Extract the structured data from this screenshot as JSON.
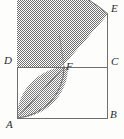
{
  "figure": {
    "kind": "geometry-diagram",
    "background_color": "#fdfdfc",
    "stroke_color": "#6b6b6b",
    "shade_fill_color": "#7a7a7a",
    "shade_pattern": "checkerboard-dither",
    "label_color": "#2b2b2b",
    "labels": [
      {
        "id": "A",
        "text": "A",
        "x": 6,
        "y": 120,
        "anchor": "bottom-left-vertex"
      },
      {
        "id": "B",
        "text": "B",
        "x": 110,
        "y": 110,
        "anchor": "bottom-right-vertex"
      },
      {
        "id": "C",
        "text": "C",
        "x": 111,
        "y": 57,
        "anchor": "top-right-of-rectangle"
      },
      {
        "id": "D",
        "text": "D",
        "x": 5,
        "y": 56,
        "anchor": "top-left-of-rectangle"
      },
      {
        "id": "E",
        "text": "E",
        "x": 111,
        "y": 4,
        "anchor": "arc-endpoint-top"
      },
      {
        "id": "F",
        "text": "F",
        "x": 66,
        "y": 61,
        "anchor": "arc-intersection-on-DC"
      }
    ],
    "points": {
      "A": {
        "x": 17,
        "y": 118
      },
      "B": {
        "x": 108,
        "y": 118
      },
      "C": {
        "x": 108,
        "y": 67
      },
      "D": {
        "x": 17,
        "y": 67
      },
      "E": {
        "x": 108,
        "y": 14
      },
      "F": {
        "x": 64,
        "y": 67
      }
    },
    "segments": [
      {
        "name": "AB",
        "from": "A",
        "to": "B"
      },
      {
        "name": "BE",
        "from": "B",
        "to": "E"
      },
      {
        "name": "DC",
        "from": "D",
        "to": "C"
      },
      {
        "name": "AD",
        "from": "A",
        "to": "D"
      },
      {
        "name": "AF-extended",
        "from": "A",
        "to": "arc"
      }
    ],
    "arcs": [
      {
        "name": "arc-E-to-A",
        "center": "A",
        "radius": 104,
        "from": "E",
        "to": "left-of-A"
      },
      {
        "name": "arc-A-to-F",
        "center": "D",
        "radius": 51,
        "from": "A",
        "to": "F"
      }
    ]
  }
}
